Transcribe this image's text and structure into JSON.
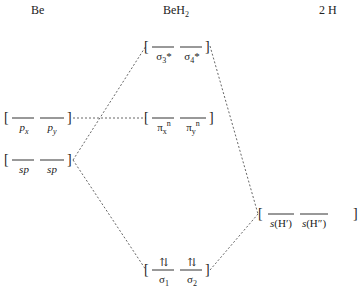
{
  "columns": {
    "left": "Be",
    "middle_main": "BeH",
    "middle_sub": "2",
    "right": "2 H"
  },
  "brackets": {
    "open": "[",
    "close": "]"
  },
  "be_orbitals": {
    "p": [
      {
        "base": "p",
        "sub": "x"
      },
      {
        "base": "p",
        "sub": "y"
      }
    ],
    "sp": [
      {
        "base": "sp"
      },
      {
        "base": "sp"
      }
    ]
  },
  "beh2_orbitals": {
    "antibonding": [
      {
        "base": "σ",
        "sub": "3",
        "sup": "*"
      },
      {
        "base": "σ",
        "sub": "4",
        "sup": "*"
      }
    ],
    "nonbonding": [
      {
        "base": "π",
        "sub": "x",
        "sup": "n"
      },
      {
        "base": "π",
        "sub": "y",
        "sup": "n"
      }
    ],
    "bonding": [
      {
        "base": "σ",
        "sub": "1",
        "electrons": "⇅"
      },
      {
        "base": "σ",
        "sub": "2",
        "electrons": "⇅"
      }
    ]
  },
  "h_orbitals": [
    {
      "base": "s",
      "arg": "(H′)"
    },
    {
      "base": "s",
      "arg": "(H″)"
    }
  ],
  "colors": {
    "line": "#333333",
    "dash": "#555555"
  }
}
